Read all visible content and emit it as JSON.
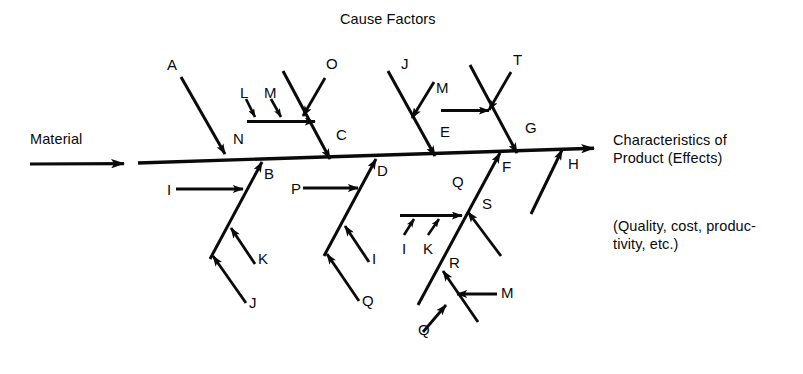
{
  "diagram": {
    "type": "fishbone-ishikawa",
    "title": "Cause Factors",
    "input_label": "Material",
    "effect_title_line1": "Characteristics of",
    "effect_title_line2": "Product (Effects)",
    "effect_note_line1": "(Quality, cost, produc-",
    "effect_note_line2": "tivity, etc.)",
    "ink_color": "#0a0a0a",
    "background_color": "#ffffff",
    "spine": {
      "start_x": 138,
      "start_y": 163,
      "end_x": 600,
      "end_y": 148
    },
    "input_arrow": {
      "start_x": 30,
      "start_y": 164,
      "end_x": 128,
      "end_y": 163
    },
    "upper_branch_labels": [
      "N",
      "C",
      "E",
      "G"
    ],
    "lower_branch_labels": [
      "B",
      "D",
      "F",
      "H"
    ],
    "cause_labels": [
      "A",
      "N",
      "L",
      "M",
      "O",
      "C",
      "J",
      "M",
      "E",
      "T",
      "G",
      "I",
      "B",
      "K",
      "J",
      "P",
      "D",
      "I",
      "Q",
      "Q",
      "I",
      "K",
      "S",
      "F",
      "R",
      "M",
      "Q",
      "H"
    ],
    "branches": [
      {
        "id": "branch-n",
        "spine_label": "N",
        "spine_label_x": 233,
        "spine_label_y": 139,
        "bone": {
          "x1": 181,
          "y1": 77,
          "x2": 226,
          "y2": 155
        },
        "sub_causes": [
          {
            "label": "A",
            "label_x": 168,
            "label_y": 60
          }
        ]
      },
      {
        "id": "branch-c",
        "spine_label": "C",
        "spine_label_x": 336,
        "spine_label_y": 134,
        "bone": {
          "x1": 283,
          "y1": 72,
          "x2": 329,
          "y2": 158
        },
        "sub_causes": [
          {
            "label": "L",
            "label_x": 240,
            "label_y": 88
          },
          {
            "label": "M",
            "label_x": 265,
            "label_y": 88
          },
          {
            "label": "O",
            "label_x": 327,
            "label_y": 58
          }
        ]
      },
      {
        "id": "branch-e",
        "spine_label": "E",
        "spine_label_x": 440,
        "spine_label_y": 131,
        "bone": {
          "x1": 388,
          "y1": 72,
          "x2": 434,
          "y2": 155
        },
        "sub_causes": [
          {
            "label": "J",
            "label_x": 401,
            "label_y": 58
          },
          {
            "label": "M",
            "label_x": 436,
            "label_y": 82
          }
        ]
      },
      {
        "id": "branch-g",
        "spine_label": "G",
        "spine_label_x": 525,
        "spine_label_y": 126,
        "bone": {
          "x1": 470,
          "y1": 66,
          "x2": 516,
          "y2": 152
        },
        "sub_causes": [
          {
            "label": "T",
            "label_x": 513,
            "label_y": 54
          }
        ]
      },
      {
        "id": "branch-b",
        "spine_label": "B",
        "spine_label_x": 263,
        "spine_label_y": 170,
        "bone": {
          "x1": 211,
          "y1": 258,
          "x2": 261,
          "y2": 163
        },
        "sub_causes": [
          {
            "label": "I",
            "label_x": 168,
            "label_y": 180
          },
          {
            "label": "K",
            "label_x": 257,
            "label_y": 253
          },
          {
            "label": "J",
            "label_x": 249,
            "label_y": 297
          }
        ]
      },
      {
        "id": "branch-d",
        "spine_label": "D",
        "spine_label_x": 377,
        "spine_label_y": 167,
        "bone": {
          "x1": 325,
          "y1": 255,
          "x2": 375,
          "y2": 160
        },
        "sub_causes": [
          {
            "label": "P",
            "label_x": 292,
            "label_y": 179
          },
          {
            "label": "I",
            "label_x": 371,
            "label_y": 252
          },
          {
            "label": "Q",
            "label_x": 362,
            "label_y": 294
          }
        ]
      },
      {
        "id": "branch-f",
        "spine_label": "F",
        "spine_label_x": 501,
        "spine_label_y": 163,
        "bone": {
          "x1": 419,
          "y1": 303,
          "x2": 499,
          "y2": 152
        },
        "sub_causes": [
          {
            "label": "Q",
            "label_x": 452,
            "label_y": 177
          },
          {
            "label": "I",
            "label_x": 403,
            "label_y": 244
          },
          {
            "label": "K",
            "label_x": 424,
            "label_y": 244
          },
          {
            "label": "S",
            "label_x": 482,
            "label_y": 199
          },
          {
            "label": "R",
            "label_x": 449,
            "label_y": 258
          },
          {
            "label": "M",
            "label_x": 500,
            "label_y": 287
          },
          {
            "label": "Q",
            "label_x": 419,
            "label_y": 325
          }
        ]
      },
      {
        "id": "branch-h",
        "spine_label": "H",
        "spine_label_x": 567,
        "spine_label_y": 160,
        "bone": {
          "x1": 531,
          "y1": 213,
          "x2": 561,
          "y2": 150
        },
        "sub_causes": []
      }
    ]
  }
}
